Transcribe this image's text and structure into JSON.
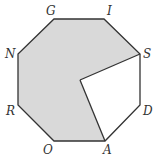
{
  "diagram": {
    "type": "regular-octagon-with-shaded-sector",
    "colors": {
      "shade": "#d9d9d9",
      "stroke": "#333333",
      "unshaded": "#ffffff"
    },
    "vertices": [
      {
        "label": "G",
        "x": 54,
        "y": 19
      },
      {
        "label": "I",
        "x": 104,
        "y": 19
      },
      {
        "label": "S",
        "x": 140,
        "y": 54
      },
      {
        "label": "D",
        "x": 140,
        "y": 105
      },
      {
        "label": "A",
        "x": 105,
        "y": 141
      },
      {
        "label": "O",
        "x": 54,
        "y": 141
      },
      {
        "label": "R",
        "x": 18,
        "y": 105
      },
      {
        "label": "N",
        "x": 18,
        "y": 54
      }
    ],
    "center": {
      "x": 80,
      "y": 80
    },
    "labels": {
      "G": "G",
      "I": "I",
      "S": "S",
      "D": "D",
      "A": "A",
      "O": "O",
      "R": "R",
      "N": "N"
    }
  }
}
